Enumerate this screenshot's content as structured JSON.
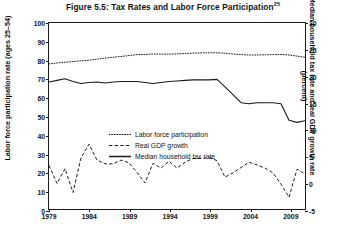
{
  "chart_data": {
    "type": "line",
    "title": "Figure 5.5: Tax Rates and Labor Force Participation",
    "title_footnote": "25",
    "xlabel": "",
    "ylabel": "Labor force participation rate (ages 25–54)",
    "ylabel_right": "Median household tax rate and real GDP growth rate (percent)",
    "xlim": [
      1979,
      2011
    ],
    "ylim": [
      0,
      100
    ],
    "ylim_right": [
      -5,
      30
    ],
    "xticks": [
      1979,
      1984,
      1989,
      1994,
      1999,
      2004,
      2009
    ],
    "xtick_labels": [
      "1979",
      "1984",
      "1989",
      "1994",
      "1999",
      "2004",
      "2009"
    ],
    "yticks": [
      0,
      10,
      20,
      30,
      40,
      50,
      60,
      70,
      80,
      90,
      100
    ],
    "ytick_labels": [
      "0",
      "10",
      "20",
      "30",
      "40",
      "50",
      "60",
      "70",
      "80",
      "90",
      "100"
    ],
    "yticks_right": [
      -5,
      0,
      5,
      10,
      15,
      20,
      25,
      30
    ],
    "ytick_labels_right": [
      "-5",
      "0",
      "5",
      "10",
      "15",
      "20",
      "25",
      "30"
    ],
    "grid": false,
    "legend_position": "center-left",
    "series": [
      {
        "name": "Labor force participation",
        "axis": "left",
        "style": "dotted",
        "color": "#1a1a1a",
        "x": [
          1979,
          1980,
          1981,
          1982,
          1983,
          1984,
          1985,
          1986,
          1987,
          1988,
          1989,
          1990,
          1991,
          1992,
          1993,
          1994,
          1995,
          1996,
          1997,
          1998,
          1999,
          2000,
          2001,
          2002,
          2003,
          2004,
          2005,
          2006,
          2007,
          2008,
          2009,
          2010,
          2011
        ],
        "values": [
          78.0,
          78.5,
          78.9,
          79.3,
          79.6,
          80.0,
          80.6,
          81.1,
          81.6,
          82.0,
          82.5,
          83.0,
          83.1,
          83.3,
          83.3,
          83.3,
          83.4,
          83.6,
          83.8,
          83.9,
          84.0,
          84.0,
          83.7,
          83.3,
          83.0,
          82.8,
          82.8,
          82.9,
          83.0,
          83.1,
          82.8,
          82.2,
          81.6
        ],
        "note": "Percent of ages 25–54 in the labor force; read on left axis."
      },
      {
        "name": "Real GDP growth",
        "axis": "right",
        "style": "dashed",
        "color": "#1a1a1a",
        "x": [
          1979,
          1980,
          1981,
          1982,
          1983,
          1984,
          1985,
          1986,
          1987,
          1988,
          1989,
          1990,
          1991,
          1992,
          1993,
          1994,
          1995,
          1996,
          1997,
          1998,
          1999,
          2000,
          2001,
          2002,
          2003,
          2004,
          2005,
          2006,
          2007,
          2008,
          2009,
          2010,
          2011
        ],
        "values": [
          3.2,
          -0.2,
          2.6,
          -1.9,
          4.6,
          7.2,
          4.2,
          3.5,
          3.5,
          4.2,
          3.7,
          1.9,
          -0.1,
          3.6,
          2.7,
          4.0,
          2.7,
          3.8,
          4.5,
          4.5,
          4.7,
          4.1,
          1.0,
          1.8,
          2.8,
          3.8,
          3.3,
          2.7,
          1.8,
          -0.3,
          -2.8,
          2.5,
          1.6
        ],
        "note": "Annual real GDP growth, percent; read on right axis."
      },
      {
        "name": "Median household tax rate",
        "axis": "right",
        "style": "solid",
        "color": "#1a1a1a",
        "x": [
          1979,
          1980,
          1981,
          1982,
          1983,
          1984,
          1985,
          1986,
          1987,
          1988,
          1989,
          1990,
          1991,
          1992,
          1993,
          1994,
          1995,
          1996,
          1997,
          1998,
          1999,
          2000,
          2001,
          2002,
          2003,
          2004,
          2005,
          2006,
          2007,
          2008,
          2009,
          2010,
          2011
        ],
        "values": [
          18.9,
          19.2,
          19.5,
          19.0,
          18.6,
          18.8,
          18.9,
          18.7,
          18.9,
          19.0,
          19.0,
          19.0,
          18.8,
          18.6,
          18.8,
          19.0,
          19.1,
          19.2,
          19.3,
          19.3,
          19.3,
          19.4,
          18.0,
          16.5,
          15.0,
          14.8,
          15.0,
          15.0,
          15.0,
          14.8,
          11.7,
          11.3,
          11.6
        ],
        "note": "Median household total federal tax rate, percent; read on right axis."
      }
    ]
  },
  "legend": {
    "items": [
      {
        "label": "Labor force participation",
        "style": "dotted"
      },
      {
        "label": "Real GDP growth",
        "style": "dashed"
      },
      {
        "label": "Median household tax rate",
        "style": "solid"
      }
    ]
  }
}
